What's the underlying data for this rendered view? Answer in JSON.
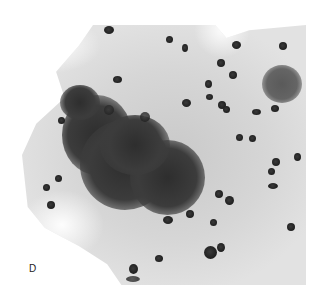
{
  "figure": {
    "panel_label": "D"
  }
}
